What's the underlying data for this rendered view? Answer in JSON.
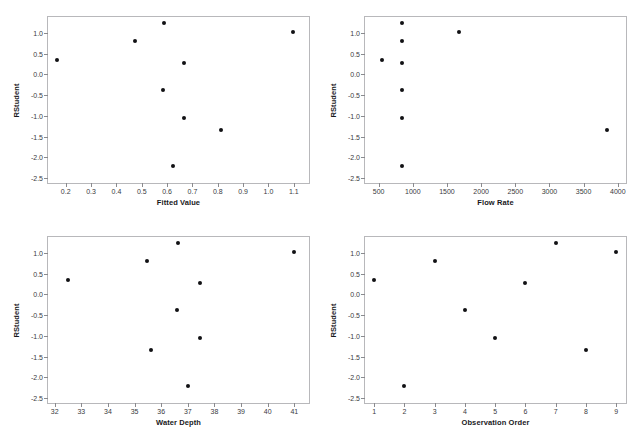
{
  "figure": {
    "title": "",
    "background_color": "#ffffff",
    "point_color": "#111114",
    "axis_color": "#b8b8bb"
  },
  "chart_data": [
    {
      "type": "scatter",
      "panel": "top-left",
      "title": "",
      "xlabel": "Fitted Value",
      "ylabel": "RStudent",
      "xlim": [
        0.13,
        1.16
      ],
      "ylim": [
        -2.62,
        1.38
      ],
      "xticks": [
        0.2,
        0.3,
        0.4,
        0.5,
        0.6,
        0.7,
        0.8,
        0.9,
        1.0,
        1.1
      ],
      "xticklabels": [
        "0.2",
        "0.3",
        "0.4",
        "0.5",
        "0.6",
        "0.7",
        "0.8",
        "0.9",
        "1.0",
        "1.1"
      ],
      "yticks": [
        1.0,
        0.5,
        0.0,
        -0.5,
        -1.0,
        -1.5,
        -2.0,
        -2.5
      ],
      "yticklabels": [
        "1.0",
        "0.5",
        "0.0",
        "-0.5",
        "-1.0",
        "-1.5",
        "-2.0",
        "-2.5"
      ],
      "grid": false,
      "legend": "none",
      "x": [
        0.165,
        0.472,
        0.588,
        0.585,
        0.625,
        0.665,
        0.668,
        0.812,
        1.095
      ],
      "y": [
        0.34,
        0.8,
        1.23,
        -0.37,
        -2.2,
        0.27,
        -1.05,
        -1.35,
        1.02
      ]
    },
    {
      "type": "scatter",
      "panel": "top-right",
      "title": "",
      "xlabel": "Flow Rate",
      "ylabel": "RStudent",
      "xlim": [
        300,
        4120
      ],
      "ylim": [
        -2.62,
        1.38
      ],
      "xticks": [
        500,
        1000,
        1500,
        2000,
        2500,
        3000,
        3500,
        4000
      ],
      "xticklabels": [
        "500",
        "1000",
        "1500",
        "2000",
        "2500",
        "3000",
        "3500",
        "4000"
      ],
      "yticks": [
        1.0,
        0.5,
        0.0,
        -0.5,
        -1.0,
        -1.5,
        -2.0,
        -2.5
      ],
      "yticklabels": [
        "1.0",
        "0.5",
        "0.0",
        "-0.5",
        "-1.0",
        "-1.5",
        "-2.0",
        "-2.5"
      ],
      "grid": false,
      "legend": "none",
      "x": [
        550,
        845,
        845,
        845,
        845,
        845,
        845,
        1680,
        3840
      ],
      "y": [
        0.34,
        1.23,
        0.8,
        0.27,
        -0.37,
        -1.05,
        -2.2,
        1.02,
        -1.35
      ]
    },
    {
      "type": "scatter",
      "panel": "bottom-left",
      "title": "",
      "xlabel": "Water Depth",
      "ylabel": "RStudent",
      "xlim": [
        31.75,
        41.55
      ],
      "ylim": [
        -2.62,
        1.38
      ],
      "xticks": [
        32,
        33,
        34,
        35,
        36,
        37,
        38,
        39,
        40,
        41
      ],
      "xticklabels": [
        "32",
        "33",
        "34",
        "35",
        "36",
        "37",
        "38",
        "39",
        "40",
        "41"
      ],
      "yticks": [
        1.0,
        0.5,
        0.0,
        -0.5,
        -1.0,
        -1.5,
        -2.0,
        -2.5
      ],
      "yticklabels": [
        "1.0",
        "0.5",
        "0.0",
        "-0.5",
        "-1.0",
        "-1.5",
        "-2.0",
        "-2.5"
      ],
      "grid": false,
      "legend": "none",
      "x": [
        32.5,
        35.45,
        36.62,
        36.6,
        37.02,
        37.45,
        37.45,
        35.62,
        41.0
      ],
      "y": [
        0.34,
        0.8,
        1.23,
        -0.37,
        -2.2,
        0.27,
        -1.05,
        -1.35,
        1.02
      ]
    },
    {
      "type": "scatter",
      "panel": "bottom-right",
      "title": "",
      "xlabel": "Observation Order",
      "ylabel": "RStudent",
      "xlim": [
        0.7,
        9.32
      ],
      "ylim": [
        -2.62,
        1.38
      ],
      "xticks": [
        1,
        2,
        3,
        4,
        5,
        6,
        7,
        8,
        9
      ],
      "xticklabels": [
        "1",
        "2",
        "3",
        "4",
        "5",
        "6",
        "7",
        "8",
        "9"
      ],
      "yticks": [
        1.0,
        0.5,
        0.0,
        -0.5,
        -1.0,
        -1.5,
        -2.0,
        -2.5
      ],
      "yticklabels": [
        "1.0",
        "0.5",
        "0.0",
        "-0.5",
        "-1.0",
        "-1.5",
        "-2.0",
        "-2.5"
      ],
      "grid": false,
      "legend": "none",
      "x": [
        1,
        2,
        3,
        4,
        5,
        6,
        7,
        8,
        9
      ],
      "y": [
        0.34,
        -2.2,
        0.8,
        -0.37,
        -1.05,
        0.27,
        1.23,
        -1.35,
        1.02
      ]
    }
  ]
}
